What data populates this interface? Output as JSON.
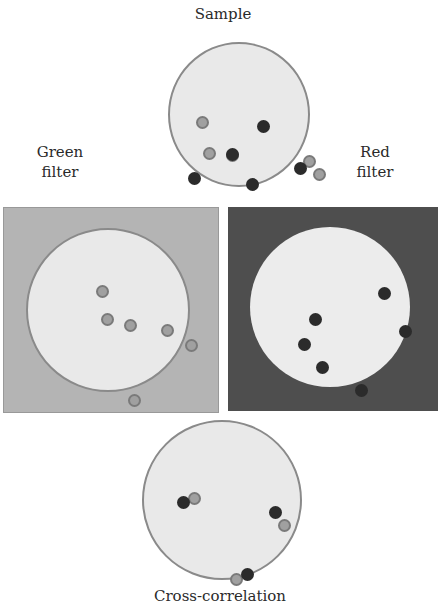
{
  "labels": {
    "sample": "Sample",
    "green_filter_line1": "Green",
    "green_filter_line2": "filter",
    "red_filter_line1": "Red",
    "red_filter_line2": "filter",
    "cross_correlation": "Cross-correlation"
  },
  "colors": {
    "green_panel_bg": "#b4b4b4",
    "red_panel_bg": "#4e4e4e",
    "dish_fill": "#e9e9e9",
    "dish_border": "#8a8a8a",
    "red_particle": "#2b2b2b",
    "green_particle": "#a0a0a0"
  },
  "dishes": {
    "sample": {
      "red": [
        [
          93,
          82
        ],
        [
          62,
          110
        ],
        [
          24,
          134
        ],
        [
          82,
          140
        ],
        [
          130,
          124
        ],
        [
          103,
          177
        ]
      ],
      "green": [
        [
          32,
          78
        ],
        [
          39,
          109
        ],
        [
          62,
          111
        ],
        [
          139,
          117
        ],
        [
          149,
          130
        ],
        [
          92,
          182
        ]
      ]
    },
    "green": {
      "green": [
        [
          74,
          61
        ],
        [
          79,
          89
        ],
        [
          102,
          95
        ],
        [
          139,
          100
        ],
        [
          163,
          115
        ],
        [
          106,
          170
        ]
      ]
    },
    "red": {
      "red": [
        [
          134,
          66
        ],
        [
          65,
          92
        ],
        [
          54,
          117
        ],
        [
          72,
          140
        ],
        [
          111,
          163
        ],
        [
          155,
          104
        ]
      ]
    },
    "cross": {
      "red": [
        [
          39,
          80
        ],
        [
          131,
          90
        ],
        [
          103,
          152
        ]
      ],
      "green": [
        [
          50,
          76
        ],
        [
          140,
          103
        ],
        [
          92,
          157
        ]
      ]
    }
  }
}
